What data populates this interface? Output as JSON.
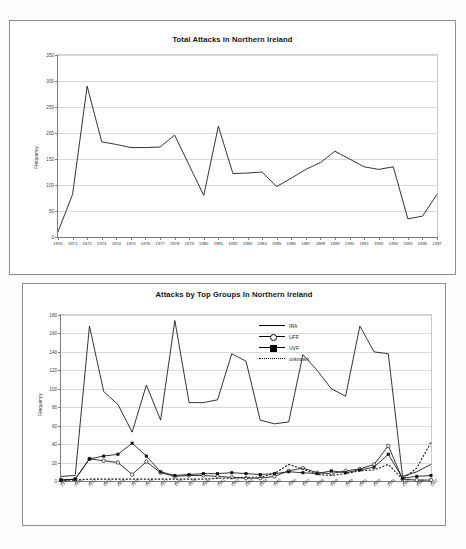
{
  "page": {
    "background": "#fdfdfd",
    "frame_color": "#8d8d8d"
  },
  "chart1": {
    "title": "Total Attacks in Northern Ireland",
    "ylabel": "Frequency"
  },
  "chart2": {
    "title": "Attacks by Top Groups In Northern Ireland",
    "ylabel": "Frequency",
    "legend": [
      {
        "label": "IRA",
        "style": "line"
      },
      {
        "label": "UFF",
        "style": "line-circle"
      },
      {
        "label": "UVF",
        "style": "line-square"
      },
      {
        "label": "unknown",
        "style": "dotted"
      }
    ]
  },
  "chart_data": [
    {
      "type": "line",
      "title": "Total Attacks in Northern Ireland",
      "xlabel": "",
      "ylabel": "Frequency",
      "ylim": [
        0,
        350
      ],
      "yticks": [
        0,
        50,
        100,
        150,
        200,
        250,
        300,
        350
      ],
      "grid": true,
      "legend": "none",
      "categories": [
        "1970",
        "1971",
        "1972",
        "1973",
        "1974",
        "1975",
        "1976",
        "1977",
        "1978",
        "1979",
        "1980",
        "1981",
        "1982",
        "1983",
        "1984",
        "1985",
        "1986",
        "1987",
        "1988",
        "1989",
        "1990",
        "1991",
        "1992",
        "1994",
        "1995",
        "1996",
        "1997"
      ],
      "values": [
        10,
        82,
        290,
        183,
        178,
        172,
        172,
        173,
        196,
        138,
        80,
        213,
        122,
        123,
        125,
        97,
        113,
        130,
        143,
        165,
        150,
        135,
        130,
        135,
        35,
        40,
        82
      ]
    },
    {
      "type": "line",
      "title": "Attacks by Top Groups In Northern Ireland",
      "xlabel": "",
      "ylabel": "Frequency",
      "ylim": [
        0,
        180
      ],
      "yticks": [
        0,
        20,
        40,
        60,
        80,
        100,
        120,
        140,
        160,
        180
      ],
      "grid": true,
      "legend": "top-center",
      "categories": [
        "1970",
        "1971",
        "1972",
        "1973",
        "1974",
        "1975",
        "1976",
        "1977",
        "1978",
        "1979",
        "1980",
        "1981",
        "1982",
        "1983",
        "1984",
        "1985",
        "1986",
        "1987",
        "1988",
        "1989",
        "1990",
        "1991",
        "1992",
        "1994",
        "1995",
        "1996",
        "1997"
      ],
      "series": [
        {
          "name": "IRA",
          "values": [
            5,
            6,
            168,
            97,
            83,
            53,
            104,
            66,
            174,
            85,
            85,
            88,
            138,
            130,
            66,
            62,
            64,
            137,
            120,
            100,
            92,
            168,
            140,
            138,
            5,
            10,
            18
          ]
        },
        {
          "name": "UFF",
          "values": [
            1,
            2,
            24,
            22,
            20,
            7,
            21,
            9,
            5,
            6,
            6,
            5,
            4,
            3,
            3,
            5,
            11,
            14,
            9,
            8,
            11,
            13,
            18,
            38,
            2,
            1,
            1
          ]
        },
        {
          "name": "UVF",
          "values": [
            1,
            2,
            24,
            27,
            29,
            41,
            27,
            10,
            6,
            7,
            8,
            8,
            9,
            8,
            7,
            8,
            10,
            9,
            8,
            11,
            9,
            12,
            15,
            29,
            3,
            5,
            6
          ]
        },
        {
          "name": "unknown",
          "values": [
            1,
            1,
            2,
            2,
            2,
            2,
            2,
            2,
            2,
            2,
            2,
            3,
            3,
            4,
            4,
            8,
            18,
            13,
            7,
            6,
            8,
            11,
            12,
            18,
            2,
            14,
            42
          ]
        }
      ]
    }
  ]
}
